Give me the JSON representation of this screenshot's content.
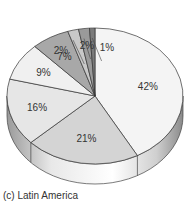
{
  "chart_data": {
    "type": "pie",
    "title": "",
    "caption": "(c) Latin America",
    "style": "3d",
    "start_angle_deg": -90,
    "direction": "clockwise",
    "slices": [
      {
        "label": "42%",
        "value": 42,
        "color": "#f4f4f4"
      },
      {
        "label": "21%",
        "value": 21,
        "color": "#d4d4d4"
      },
      {
        "label": "16%",
        "value": 16,
        "color": "#e6e6e6"
      },
      {
        "label": "9%",
        "value": 9,
        "color": "#f0f0f0"
      },
      {
        "label": "7%",
        "value": 7,
        "color": "#a8a8a8"
      },
      {
        "label": "2%",
        "value": 2,
        "color": "#c8c8c8"
      },
      {
        "label": "2%",
        "value": 2,
        "color": "#9a9a9a"
      },
      {
        "label": "1%",
        "value": 1,
        "color": "#7a7a7a"
      }
    ],
    "values": [
      42,
      21,
      16,
      9,
      7,
      2,
      2,
      1
    ],
    "categories": [
      "42%",
      "21%",
      "16%",
      "9%",
      "7%",
      "2%",
      "2%",
      "1%"
    ]
  }
}
